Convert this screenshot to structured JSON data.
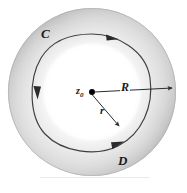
{
  "figure": {
    "background_color": "#ffffff",
    "labels": {
      "outer_contour": "C",
      "inner_contour": "D",
      "center_point": "z",
      "center_point_subscript": "0",
      "outer_radius": "R",
      "inner_radius": "r"
    },
    "geometry": {
      "center_x": 92,
      "center_y": 92,
      "outer_radius_px": 84,
      "inner_radius_px": 46,
      "contour_radius_px": 58
    },
    "colors": {
      "annulus_light": "#fdfdfd",
      "annulus_mid": "#e3e3e3",
      "annulus_dark": "#c4c4c4",
      "contour_stroke": "#3a3a3a",
      "leader_stroke": "#2b2b2b",
      "center_dot": "#000000"
    },
    "orientation": "clockwise",
    "arrow_count": 3,
    "baseline_rule": true
  }
}
